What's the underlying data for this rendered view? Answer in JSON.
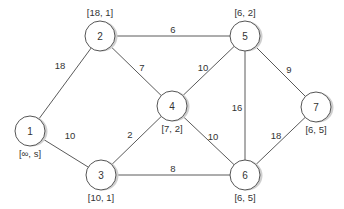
{
  "diagram": {
    "type": "weighted-undirected-graph",
    "colors": {
      "edge": "#5a5a5a",
      "node_stroke": "#555555",
      "node_fill": "#ffffff",
      "node_shadow": "#cfcfcf",
      "text": "#333333"
    },
    "nodes": [
      {
        "id": "1",
        "label": "[∞, s]",
        "x": 30,
        "y": 131,
        "label_pos": "below"
      },
      {
        "id": "2",
        "label": "[18, 1]",
        "x": 100,
        "y": 36,
        "label_pos": "above"
      },
      {
        "id": "3",
        "label": "[10, 1]",
        "x": 101,
        "y": 175,
        "label_pos": "below"
      },
      {
        "id": "4",
        "label": "[7, 2]",
        "x": 172,
        "y": 106,
        "label_pos": "below"
      },
      {
        "id": "5",
        "label": "[6, 2]",
        "x": 245,
        "y": 36,
        "label_pos": "above"
      },
      {
        "id": "6",
        "label": "[6, 5]",
        "x": 245,
        "y": 175,
        "label_pos": "below"
      },
      {
        "id": "7",
        "label": "[6, 5]",
        "x": 316,
        "y": 107,
        "label_pos": "below"
      }
    ],
    "edges": [
      {
        "from": "1",
        "to": "2",
        "weight": "18",
        "lx": 60,
        "ly": 69
      },
      {
        "from": "1",
        "to": "3",
        "weight": "10",
        "lx": 70,
        "ly": 139
      },
      {
        "from": "2",
        "to": "5",
        "weight": "6",
        "lx": 173,
        "ly": 33
      },
      {
        "from": "2",
        "to": "4",
        "weight": "7",
        "lx": 142,
        "ly": 71
      },
      {
        "from": "3",
        "to": "4",
        "weight": "2",
        "lx": 130,
        "ly": 138
      },
      {
        "from": "3",
        "to": "6",
        "weight": "8",
        "lx": 173,
        "ly": 172
      },
      {
        "from": "4",
        "to": "5",
        "weight": "10",
        "lx": 203,
        "ly": 71
      },
      {
        "from": "4",
        "to": "6",
        "weight": "10",
        "lx": 213,
        "ly": 140
      },
      {
        "from": "5",
        "to": "6",
        "weight": "16",
        "lx": 237,
        "ly": 111
      },
      {
        "from": "5",
        "to": "7",
        "weight": "9",
        "lx": 289,
        "ly": 73
      },
      {
        "from": "6",
        "to": "7",
        "weight": "18",
        "lx": 276,
        "ly": 139
      }
    ]
  }
}
